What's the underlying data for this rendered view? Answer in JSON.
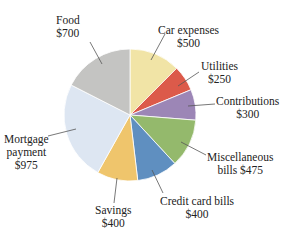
{
  "chart_data": {
    "type": "pie",
    "title": "",
    "total": 4000,
    "start_angle_deg": 0,
    "direction": "clockwise",
    "slices": [
      {
        "label": "Car expenses",
        "value": 500,
        "value_label": "$500",
        "color": "#f1e4a6"
      },
      {
        "label": "Utilities",
        "value": 250,
        "value_label": "$250",
        "color": "#dc5a4a"
      },
      {
        "label": "Contributions",
        "value": 300,
        "value_label": "$300",
        "color": "#9c86b6"
      },
      {
        "label": "Miscellaneous bills",
        "value": 475,
        "value_label": "$475",
        "color": "#94b96c"
      },
      {
        "label": "Credit card bills",
        "value": 400,
        "value_label": "$400",
        "color": "#5f8fc0"
      },
      {
        "label": "Savings",
        "value": 400,
        "value_label": "$400",
        "color": "#efc56c"
      },
      {
        "label": "Mortgage payment",
        "value": 975,
        "value_label": "$975",
        "color": "#dde6f2"
      },
      {
        "label": "Food",
        "value": 700,
        "value_label": "$700",
        "color": "#c4c4c2"
      }
    ]
  },
  "labels": {
    "food": {
      "line1": "Food",
      "line2": "$700"
    },
    "car": {
      "line1": "Car expenses",
      "line2": "$500"
    },
    "utilities": {
      "line1": "Utilities",
      "line2": "$250"
    },
    "contributions": {
      "line1": "Contributions",
      "line2": "$300"
    },
    "misc": {
      "line1": "Miscellaneous",
      "line2": "bills  $475"
    },
    "credit": {
      "line1": "Credit card bills",
      "line2": "$400"
    },
    "savings": {
      "line1": "Savings",
      "line2": "$400"
    },
    "mortgage": {
      "line1": "Mortgage",
      "line2": "payment",
      "line3": "$975"
    }
  }
}
